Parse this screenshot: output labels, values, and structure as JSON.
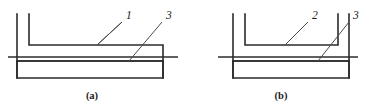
{
  "figure": {
    "type": "engineering-cross-section-diagram",
    "background_color": "#ffffff",
    "line_color": "#2b2b2b",
    "leader_color": "#4a4a4a",
    "width": 375,
    "height": 107,
    "subfigures": [
      {
        "id": "a",
        "caption": "(a)",
        "caption_x": 92,
        "caption_y": 99,
        "description": "asymmetric L-shaped profile over base box",
        "callouts": [
          {
            "label": "1",
            "text_x": 126,
            "text_y": 19,
            "leader_x1": 122,
            "leader_y1": 22,
            "leader_x2": 97,
            "leader_y2": 45
          },
          {
            "label": "3",
            "text_x": 166,
            "text_y": 19,
            "leader_x1": 162,
            "leader_y1": 22,
            "leader_x2": 129,
            "leader_y2": 61
          }
        ]
      },
      {
        "id": "b",
        "caption": "(b)",
        "caption_x": 281,
        "caption_y": 99,
        "description": "symmetric U-shaped profile over base box",
        "callouts": [
          {
            "label": "2",
            "text_x": 312,
            "text_y": 19,
            "leader_x1": 308,
            "leader_y1": 22,
            "leader_x2": 285,
            "leader_y2": 45
          },
          {
            "label": "3",
            "text_x": 353,
            "text_y": 19,
            "leader_x1": 349,
            "leader_y1": 22,
            "leader_x2": 318,
            "leader_y2": 61
          }
        ]
      }
    ],
    "geometry": {
      "a_outer_wall": "M 17 14 L 17 78",
      "a_inner_profile": "M 29 14 L 29 45 L 163 45 L 163 78",
      "a_base_box": "M 17 61 L 17 78 L 163 78 L 163 61 Z",
      "a_base_top_edge": "M 17 61 L 163 61",
      "a_centerline": "M 8 57 L 178 57",
      "b_outer_left_wall": "M 233 14 L 233 78",
      "b_inner_profile": "M 245 14 L 245 45 L 338 45 L 338 14",
      "b_right_wall": "M 349 14 L 349 78",
      "b_base_box": "M 233 61 L 233 78 L 349 78 L 349 61 Z",
      "b_base_top_edge": "M 233 61 L 349 61",
      "b_centerline": "M 218 57 L 358 57"
    }
  }
}
